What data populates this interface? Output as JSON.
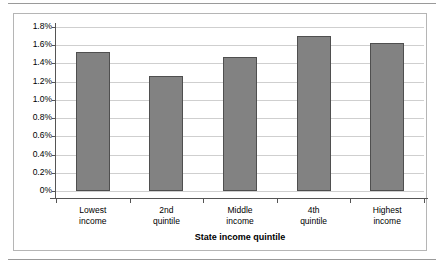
{
  "chart_data": {
    "type": "bar",
    "title": "",
    "xlabel": "State income quintile",
    "ylabel": "",
    "categories": [
      "Lowest income",
      "2nd quintile",
      "Middle income",
      "4th quintile",
      "Highest income"
    ],
    "category_lines": [
      [
        "Lowest",
        "income"
      ],
      [
        "2nd",
        "quintile"
      ],
      [
        "Middle",
        "income"
      ],
      [
        "4th",
        "quintile"
      ],
      [
        "Highest",
        "income"
      ]
    ],
    "values": [
      1.53,
      1.26,
      1.47,
      1.7,
      1.62
    ],
    "value_labels": [
      "1.53%",
      "1.26%",
      "1.47%",
      "1.70%",
      "1.62%"
    ],
    "ylim": [
      0,
      1.8
    ],
    "ytick_values": [
      1.8,
      1.6,
      1.4,
      1.2,
      1.0,
      0.8,
      0.6,
      0.4,
      0.2,
      0
    ],
    "ytick_labels": [
      "1.8%",
      "1.6%",
      "1.4%",
      "1.2%",
      "1.0%",
      "0.8%",
      "0.6%",
      "0.4%",
      "0.2%",
      "0%"
    ],
    "grid": true,
    "legend": false,
    "legend_position": "none",
    "bar_color": "#828282",
    "bar_border_color": "#4f4f4f",
    "gridline_color": "#cfcfcf",
    "axis_color": "#555555",
    "frame_color": "#b5b5b5",
    "background_color": "#ffffff"
  }
}
